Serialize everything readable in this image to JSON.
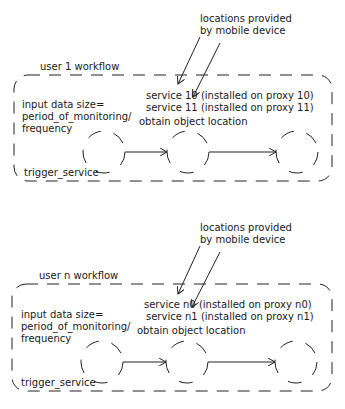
{
  "diagram": {
    "workflows": [
      {
        "title": "user 1 workflow",
        "annotation": [
          "locations provided",
          "by mobile device"
        ],
        "input_label": [
          "input data size=",
          "period_of_monitoring/",
          "frequency"
        ],
        "service_lines": [
          "service 10 (installed on proxy 10)",
          "service 11 (installed on proxy 11)"
        ],
        "service_a": "service 10",
        "service_a_rest": "(installed on proxy 10)",
        "service_b": "service 11 (installed on proxy 11)",
        "step_label": "obtain object location",
        "trigger_label": "trigger_service",
        "nodes": 3
      },
      {
        "title": "user n workflow",
        "annotation": [
          "locations provided",
          "by mobile device"
        ],
        "input_label": [
          "input data size=",
          "period_of_monitoring/",
          "frequency"
        ],
        "service_lines": [
          "service n0 (installed on proxy n0)",
          "service n1 (installed on proxy n1)"
        ],
        "service_a": "service n0",
        "service_a_rest": "(installed on proxy n0)",
        "service_b": "service n1 (installed on proxy n1)",
        "step_label": "obtain object location",
        "trigger_label": "trigger_service",
        "nodes": 3
      }
    ],
    "colors": {
      "stroke": "#222222",
      "text": "#1a1a1a",
      "background": "#ffffff"
    }
  }
}
